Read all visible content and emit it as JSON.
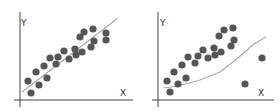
{
  "chart_data": [
    {
      "type": "scatter",
      "title": "",
      "xlabel": "X",
      "ylabel": "Y",
      "grid": false,
      "description": "Well-fitting linear regression line through scatter points",
      "points": [
        [
          28,
          81
        ],
        [
          31,
          93
        ],
        [
          36,
          72
        ],
        [
          39,
          85
        ],
        [
          44,
          66
        ],
        [
          47,
          78
        ],
        [
          50,
          58
        ],
        [
          56,
          64
        ],
        [
          58,
          57
        ],
        [
          64,
          51
        ],
        [
          69,
          59
        ],
        [
          75,
          49
        ],
        [
          76,
          55
        ],
        [
          80,
          37
        ],
        [
          82,
          52
        ],
        [
          84,
          32
        ],
        [
          93,
          29
        ],
        [
          94,
          41
        ],
        [
          91,
          47
        ],
        [
          106,
          33
        ],
        [
          106,
          40
        ]
      ],
      "fit_line": [
        [
          22,
          92
        ],
        [
          118,
          18
        ]
      ]
    },
    {
      "type": "scatter",
      "title": "",
      "xlabel": "X",
      "ylabel": "Y",
      "grid": false,
      "description": "Poorly-fitting curve pulled by outliers",
      "points": [
        [
          167,
          81
        ],
        [
          170,
          92
        ],
        [
          174,
          72
        ],
        [
          178,
          84
        ],
        [
          182,
          65
        ],
        [
          186,
          78
        ],
        [
          188,
          57
        ],
        [
          195,
          63
        ],
        [
          198,
          56
        ],
        [
          203,
          50
        ],
        [
          208,
          58
        ],
        [
          214,
          48
        ],
        [
          215,
          55
        ],
        [
          219,
          36
        ],
        [
          221,
          52
        ],
        [
          224,
          30
        ],
        [
          233,
          28
        ],
        [
          234,
          40
        ],
        [
          231,
          46
        ],
        [
          262,
          58
        ],
        [
          245,
          84
        ]
      ],
      "fit_curve": [
        [
          163,
          88
        ],
        [
          178,
          86
        ],
        [
          200,
          80
        ],
        [
          220,
          72
        ],
        [
          238,
          58
        ],
        [
          254,
          44
        ],
        [
          266,
          37
        ]
      ]
    }
  ],
  "labels": {
    "x": "X",
    "y": "Y"
  },
  "colors": {
    "dot": "#555555",
    "line": "#aaaaaa",
    "axis": "#444444"
  }
}
